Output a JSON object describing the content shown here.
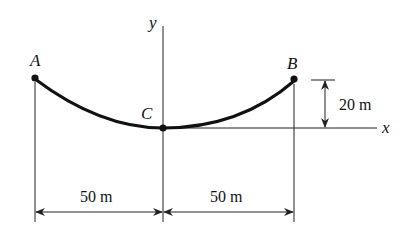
{
  "figure": {
    "points": {
      "A": {
        "label": "A"
      },
      "B": {
        "label": "B"
      },
      "C": {
        "label": "C"
      }
    },
    "axes": {
      "x_label": "x",
      "y_label": "y"
    },
    "dimensions": {
      "height_label": "20 m",
      "left_span_label": "50 m",
      "right_span_label": "50 m"
    },
    "colors": {
      "ink": "#111111",
      "background": "#ffffff"
    }
  }
}
